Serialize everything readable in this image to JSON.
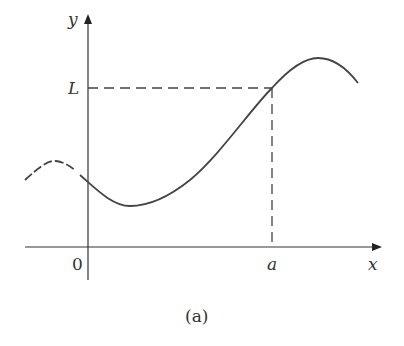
{
  "figure": {
    "caption": "(a)",
    "axes": {
      "x_label": "x",
      "y_label": "y",
      "origin_label": "0"
    },
    "annotations": {
      "limit_label": "L",
      "point_label": "a"
    },
    "colors": {
      "curve": "#444444",
      "axes": "#333333",
      "dashed": "#444444"
    }
  }
}
